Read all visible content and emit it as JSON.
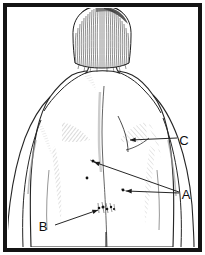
{
  "figure": {
    "type": "medical-line-illustration",
    "orientation": "back view, head at top, arms at sides",
    "frame": {
      "present": true,
      "style": "solid black rectangular border",
      "border_color": "#141414",
      "border_width_px": 4,
      "outer_margin_px": 3,
      "background_color": "#ffffff"
    },
    "palette": {
      "ink": "#1a1a1a",
      "line": "#262626",
      "hatch": "#8c8c8c",
      "light_hatch": "#b5b5b5",
      "lesion": "#111111",
      "paper": "#ffffff"
    },
    "labels": [
      {
        "id": "C",
        "text": "C",
        "x": 184,
        "y": 142,
        "points_to": "left scapular / lateral chest region below shoulder blade",
        "arrow_tip": {
          "x": 130,
          "y": 140
        },
        "arrow_tail": {
          "x": 177,
          "y": 138
        }
      },
      {
        "id": "A",
        "text": "A",
        "x": 186,
        "y": 196,
        "points_to": "two separate small macules on the mid and lower back",
        "arrow_tips": [
          {
            "x": 93,
            "y": 162
          },
          {
            "x": 124,
            "y": 191
          }
        ],
        "arrow_tail": {
          "x": 179,
          "y": 192
        }
      },
      {
        "id": "B",
        "text": "B",
        "x": 43,
        "y": 228,
        "points_to": "cluster of grouped vesicular lesions on the lower left flank",
        "arrow_tip": {
          "x": 99,
          "y": 209
        },
        "arrow_tail": {
          "x": 55,
          "y": 225
        }
      }
    ],
    "lesions": [
      {
        "ref": "A",
        "x": 93,
        "y": 161,
        "size": 2.2,
        "kind": "macule"
      },
      {
        "ref": "A",
        "x": 87,
        "y": 178,
        "size": 2.0,
        "kind": "macule"
      },
      {
        "ref": "A",
        "x": 123,
        "y": 190,
        "size": 2.0,
        "kind": "macule"
      },
      {
        "ref": "B",
        "x": 104,
        "y": 208,
        "size": 3.0,
        "kind": "grouped-vesicle-cluster"
      }
    ],
    "anatomy": {
      "hair_style": "straight chin-length bob, dense vertical pen strokes",
      "features": [
        "head with bob haircut",
        "neck and trapezius",
        "both shoulders",
        "spine midline groove",
        "scapular shading",
        "left arm",
        "right arm",
        "waist and flank",
        "lower back cropped by frame"
      ]
    },
    "caption": ""
  }
}
